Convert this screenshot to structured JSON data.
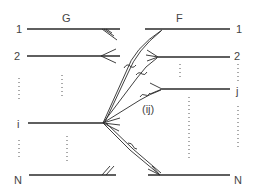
{
  "diagram": {
    "left_group_label": "G",
    "right_group_label": "F",
    "left_row_labels": [
      "1",
      "2",
      "i",
      "N"
    ],
    "right_row_labels": [
      "1",
      "2",
      "j",
      "N"
    ],
    "connection_label": "(ij)"
  }
}
